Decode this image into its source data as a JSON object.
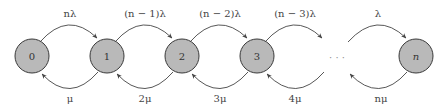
{
  "diagram": {
    "type": "birth-death-chain",
    "nodes": [
      {
        "id": "0",
        "label": "0",
        "cx": 32,
        "italic": false
      },
      {
        "id": "1",
        "label": "1",
        "cx": 107,
        "italic": false
      },
      {
        "id": "2",
        "label": "2",
        "cx": 182,
        "italic": false
      },
      {
        "id": "3",
        "label": "3",
        "cx": 257,
        "italic": false
      },
      {
        "id": "n",
        "label": "n",
        "cx": 416,
        "italic": true
      }
    ],
    "ellipsis": {
      "label": "· · ·",
      "cx": 337
    },
    "forward_transitions": [
      {
        "from": "0",
        "to": "1",
        "label": "nλ"
      },
      {
        "from": "1",
        "to": "2",
        "label": "(n − 1)λ"
      },
      {
        "from": "2",
        "to": "3",
        "label": "(n − 2)λ"
      },
      {
        "from": "3",
        "to": "…",
        "label": "(n − 3)λ"
      },
      {
        "from": "…",
        "to": "n",
        "label": "λ"
      }
    ],
    "backward_transitions": [
      {
        "from": "1",
        "to": "0",
        "label": "μ"
      },
      {
        "from": "2",
        "to": "1",
        "label": "2μ"
      },
      {
        "from": "3",
        "to": "2",
        "label": "3μ"
      },
      {
        "from": "…",
        "to": "3",
        "label": "4μ"
      },
      {
        "from": "n",
        "to": "…",
        "label": "nμ"
      }
    ],
    "colors": {
      "node_fill": "#b9b9b9",
      "node_stroke": "#3a3a3a",
      "arc": "#444444",
      "text": "#333333"
    }
  }
}
